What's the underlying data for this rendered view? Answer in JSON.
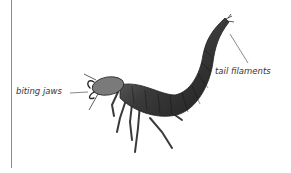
{
  "labels": {
    "biting_jaws": "biting jaws",
    "tail_filaments": "tail filaments"
  },
  "colors": {
    "body_dark": "#2a2a2a",
    "body_mid": "#5a5a5a",
    "body_light": "#9a9a9a",
    "leader_line": "#555555",
    "rule": "#8a8a8a"
  }
}
